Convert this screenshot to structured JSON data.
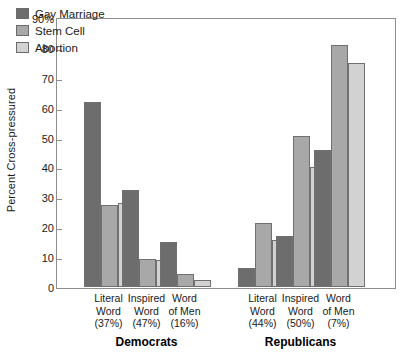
{
  "chart_data": {
    "type": "bar",
    "title": "",
    "xlabel": "",
    "ylabel": "Percent Cross-pressured",
    "ylim": [
      0,
      90
    ],
    "ytick_labels": [
      "90%",
      "80",
      "70",
      "60",
      "50",
      "40",
      "30",
      "20",
      "10",
      "0"
    ],
    "ytick_values": [
      90,
      80,
      70,
      60,
      50,
      40,
      30,
      20,
      10,
      0
    ],
    "grid": false,
    "legend_position": "top-left",
    "categories": [
      "Literal Word (37%)",
      "Inspired Word (47%)",
      "Word of Men (16%)",
      "Literal Word (44%)",
      "Inspired Word (50%)",
      "Word of Men (7%)"
    ],
    "category_labels": [
      {
        "line1": "Literal",
        "line2": "Word",
        "line3": "(37%)"
      },
      {
        "line1": "Inspired",
        "line2": "Word",
        "line3": "(47%)"
      },
      {
        "line1": "Word",
        "line2": "of Men",
        "line3": "(16%)"
      },
      {
        "line1": "Literal",
        "line2": "Word",
        "line3": "(44%)"
      },
      {
        "line1": "Inspired",
        "line2": "Word",
        "line3": "(50%)"
      },
      {
        "line1": "Word",
        "line2": "of Men",
        "line3": "(7%)"
      }
    ],
    "groups": [
      {
        "label": "Democrats",
        "categories": [
          0,
          1,
          2
        ]
      },
      {
        "label": "Republicans",
        "categories": [
          3,
          4,
          5
        ]
      }
    ],
    "series": [
      {
        "name": "Gay Marriage",
        "color": "#6d6d6d",
        "values": [
          62,
          32.5,
          15,
          6.3,
          17,
          46
        ]
      },
      {
        "name": "Stem Cell",
        "color": "#a8a8a8",
        "values": [
          27.5,
          9.5,
          4.3,
          21.5,
          50.5,
          81
        ]
      },
      {
        "name": "Abortion",
        "color": "#d2d2d2",
        "values": [
          28,
          9,
          2.5,
          15.8,
          40,
          75
        ]
      }
    ]
  }
}
